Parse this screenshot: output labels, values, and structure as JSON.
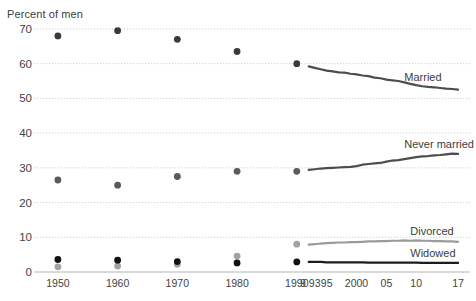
{
  "chart_data": {
    "type": "line",
    "title": "",
    "ylabel": "Percent of men",
    "xlabel": "",
    "ylim": [
      0,
      72
    ],
    "yticks": [
      0,
      10,
      20,
      30,
      40,
      50,
      60,
      70
    ],
    "ytick_labels": [
      "0",
      "10",
      "20",
      "30",
      "40",
      "50",
      "60",
      "70"
    ],
    "grid": true,
    "legend_position": "inline-right",
    "xlim": [
      1946,
      2019
    ],
    "xticks": [
      1950,
      1960,
      1970,
      1980,
      1990,
      1991,
      1993,
      1995,
      2000,
      2005,
      2010,
      2017
    ],
    "xtick_labels": [
      "1950",
      "1960",
      "1970",
      "1980",
      "1990",
      "9",
      "93",
      "95",
      "2000",
      "05",
      "10",
      "17"
    ],
    "series": [
      {
        "name": "Married",
        "color": "#4d4d4d",
        "marker_color": "#3a3a3a",
        "points": [
          {
            "x": 1950,
            "y": 68.0
          },
          {
            "x": 1960,
            "y": 69.5
          },
          {
            "x": 1970,
            "y": 67.0
          },
          {
            "x": 1980,
            "y": 63.5
          },
          {
            "x": 1990,
            "y": 60.0
          }
        ],
        "line": [
          {
            "x": 1992,
            "y": 59.2
          },
          {
            "x": 1993,
            "y": 58.8
          },
          {
            "x": 1994,
            "y": 58.4
          },
          {
            "x": 1995,
            "y": 58.0
          },
          {
            "x": 1996,
            "y": 57.8
          },
          {
            "x": 1997,
            "y": 57.5
          },
          {
            "x": 1998,
            "y": 57.4
          },
          {
            "x": 1999,
            "y": 57.1
          },
          {
            "x": 2000,
            "y": 56.9
          },
          {
            "x": 2001,
            "y": 56.6
          },
          {
            "x": 2002,
            "y": 56.4
          },
          {
            "x": 2003,
            "y": 56.0
          },
          {
            "x": 2004,
            "y": 55.8
          },
          {
            "x": 2005,
            "y": 55.4
          },
          {
            "x": 2006,
            "y": 55.2
          },
          {
            "x": 2007,
            "y": 55.0
          },
          {
            "x": 2008,
            "y": 54.6
          },
          {
            "x": 2009,
            "y": 54.2
          },
          {
            "x": 2010,
            "y": 53.8
          },
          {
            "x": 2011,
            "y": 53.5
          },
          {
            "x": 2012,
            "y": 53.3
          },
          {
            "x": 2013,
            "y": 53.2
          },
          {
            "x": 2014,
            "y": 53.0
          },
          {
            "x": 2015,
            "y": 52.8
          },
          {
            "x": 2016,
            "y": 52.7
          },
          {
            "x": 2017,
            "y": 52.5
          }
        ]
      },
      {
        "name": "Never married",
        "color": "#4d4d4d",
        "marker_color": "#5a5a5a",
        "points": [
          {
            "x": 1950,
            "y": 26.5
          },
          {
            "x": 1960,
            "y": 25.0
          },
          {
            "x": 1970,
            "y": 27.5
          },
          {
            "x": 1980,
            "y": 29.0
          },
          {
            "x": 1990,
            "y": 29.0
          }
        ],
        "line": [
          {
            "x": 1992,
            "y": 29.4
          },
          {
            "x": 1993,
            "y": 29.6
          },
          {
            "x": 1994,
            "y": 29.8
          },
          {
            "x": 1995,
            "y": 29.9
          },
          {
            "x": 1996,
            "y": 30.0
          },
          {
            "x": 1997,
            "y": 30.1
          },
          {
            "x": 1998,
            "y": 30.2
          },
          {
            "x": 1999,
            "y": 30.3
          },
          {
            "x": 2000,
            "y": 30.5
          },
          {
            "x": 2001,
            "y": 30.9
          },
          {
            "x": 2002,
            "y": 31.1
          },
          {
            "x": 2003,
            "y": 31.3
          },
          {
            "x": 2004,
            "y": 31.4
          },
          {
            "x": 2005,
            "y": 31.8
          },
          {
            "x": 2006,
            "y": 32.1
          },
          {
            "x": 2007,
            "y": 32.2
          },
          {
            "x": 2008,
            "y": 32.5
          },
          {
            "x": 2009,
            "y": 32.8
          },
          {
            "x": 2010,
            "y": 33.1
          },
          {
            "x": 2011,
            "y": 33.3
          },
          {
            "x": 2012,
            "y": 33.4
          },
          {
            "x": 2013,
            "y": 33.6
          },
          {
            "x": 2014,
            "y": 33.7
          },
          {
            "x": 2015,
            "y": 33.9
          },
          {
            "x": 2016,
            "y": 34.1
          },
          {
            "x": 2017,
            "y": 34.0
          }
        ]
      },
      {
        "name": "Divorced",
        "color": "#9a9a9a",
        "marker_color": "#a3a3a3",
        "points": [
          {
            "x": 1950,
            "y": 1.5
          },
          {
            "x": 1960,
            "y": 1.7
          },
          {
            "x": 1970,
            "y": 2.2
          },
          {
            "x": 1980,
            "y": 4.6
          },
          {
            "x": 1990,
            "y": 8.0
          }
        ],
        "line": [
          {
            "x": 1992,
            "y": 7.9
          },
          {
            "x": 1993,
            "y": 8.0
          },
          {
            "x": 1994,
            "y": 8.2
          },
          {
            "x": 1995,
            "y": 8.3
          },
          {
            "x": 1996,
            "y": 8.4
          },
          {
            "x": 1997,
            "y": 8.5
          },
          {
            "x": 1998,
            "y": 8.5
          },
          {
            "x": 1999,
            "y": 8.6
          },
          {
            "x": 2000,
            "y": 8.6
          },
          {
            "x": 2001,
            "y": 8.7
          },
          {
            "x": 2002,
            "y": 8.8
          },
          {
            "x": 2003,
            "y": 8.8
          },
          {
            "x": 2004,
            "y": 8.9
          },
          {
            "x": 2005,
            "y": 8.9
          },
          {
            "x": 2006,
            "y": 9.0
          },
          {
            "x": 2007,
            "y": 9.0
          },
          {
            "x": 2008,
            "y": 9.1
          },
          {
            "x": 2009,
            "y": 9.0
          },
          {
            "x": 2010,
            "y": 9.1
          },
          {
            "x": 2011,
            "y": 9.0
          },
          {
            "x": 2012,
            "y": 9.0
          },
          {
            "x": 2013,
            "y": 8.9
          },
          {
            "x": 2014,
            "y": 8.9
          },
          {
            "x": 2015,
            "y": 8.8
          },
          {
            "x": 2016,
            "y": 8.8
          },
          {
            "x": 2017,
            "y": 8.7
          }
        ]
      },
      {
        "name": "Widowed",
        "color": "#1c1c1c",
        "marker_color": "#111111",
        "points": [
          {
            "x": 1950,
            "y": 3.6
          },
          {
            "x": 1960,
            "y": 3.4
          },
          {
            "x": 1970,
            "y": 3.0
          },
          {
            "x": 1980,
            "y": 2.6
          },
          {
            "x": 1990,
            "y": 2.9
          }
        ],
        "line": [
          {
            "x": 1992,
            "y": 2.9
          },
          {
            "x": 1993,
            "y": 2.9
          },
          {
            "x": 1994,
            "y": 2.9
          },
          {
            "x": 1995,
            "y": 2.8
          },
          {
            "x": 1996,
            "y": 2.8
          },
          {
            "x": 1997,
            "y": 2.8
          },
          {
            "x": 1998,
            "y": 2.8
          },
          {
            "x": 1999,
            "y": 2.8
          },
          {
            "x": 2000,
            "y": 2.8
          },
          {
            "x": 2001,
            "y": 2.8
          },
          {
            "x": 2002,
            "y": 2.7
          },
          {
            "x": 2003,
            "y": 2.7
          },
          {
            "x": 2004,
            "y": 2.7
          },
          {
            "x": 2005,
            "y": 2.7
          },
          {
            "x": 2006,
            "y": 2.7
          },
          {
            "x": 2007,
            "y": 2.7
          },
          {
            "x": 2008,
            "y": 2.7
          },
          {
            "x": 2009,
            "y": 2.7
          },
          {
            "x": 2010,
            "y": 2.7
          },
          {
            "x": 2011,
            "y": 2.6
          },
          {
            "x": 2012,
            "y": 2.6
          },
          {
            "x": 2013,
            "y": 2.6
          },
          {
            "x": 2014,
            "y": 2.6
          },
          {
            "x": 2015,
            "y": 2.6
          },
          {
            "x": 2016,
            "y": 2.6
          },
          {
            "x": 2017,
            "y": 2.6
          }
        ]
      }
    ],
    "annotations": [
      {
        "text": "Married",
        "x": 2008,
        "y": 55.8
      },
      {
        "text": "Never married",
        "x": 2008,
        "y": 36.5
      },
      {
        "text": "Divorced",
        "x": 2009,
        "y": 11.5
      },
      {
        "text": "Widowed",
        "x": 2009,
        "y": 5.2
      }
    ]
  }
}
